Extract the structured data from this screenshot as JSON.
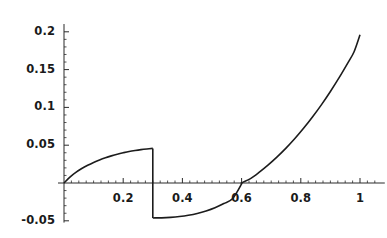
{
  "chart_data": {
    "type": "line",
    "title": "",
    "subtitle": "",
    "xlabel": "",
    "ylabel": "",
    "xlim": [
      0.0,
      1.05
    ],
    "ylim": [
      -0.055,
      0.205
    ],
    "grid": false,
    "legend": "none",
    "axis_style": "mathematica-crossed-axes",
    "x_ticks_major": [
      0.2,
      0.4,
      0.6,
      0.8,
      1
    ],
    "x_tick_labels": [
      "0.2",
      "0.4",
      "0.6",
      "0.8",
      "1"
    ],
    "y_ticks_major": [
      0.2,
      0.15,
      0.1,
      0.05,
      -0.05
    ],
    "y_tick_labels": [
      "0.2",
      "0.15",
      "0.1",
      "0.05",
      "-0.05"
    ],
    "x_minor_tick_step": 0.025,
    "y_minor_tick_step": 0.01,
    "discontinuity_x": 0.3,
    "zero_crossing_x": 0.6,
    "series": [
      {
        "name": "curve",
        "color": "#1c1c1c",
        "line_width": 1.6,
        "segments": [
          {
            "name": "rising-arc-segment",
            "points": [
              [
                0.0,
                0.0
              ],
              [
                0.02,
                0.0078
              ],
              [
                0.04,
                0.014
              ],
              [
                0.06,
                0.0191
              ],
              [
                0.08,
                0.0234
              ],
              [
                0.1,
                0.0272
              ],
              [
                0.12,
                0.0305
              ],
              [
                0.14,
                0.0334
              ],
              [
                0.16,
                0.0359
              ],
              [
                0.18,
                0.0381
              ],
              [
                0.2,
                0.04
              ],
              [
                0.22,
                0.0417
              ],
              [
                0.24,
                0.043
              ],
              [
                0.26,
                0.0441
              ],
              [
                0.28,
                0.045
              ],
              [
                0.3,
                0.0458
              ]
            ]
          },
          {
            "name": "vertical-jump-segment",
            "points": [
              [
                0.3,
                0.0458
              ],
              [
                0.3,
                -0.0462
              ]
            ]
          },
          {
            "name": "rising-parabolic-segment",
            "points": [
              [
                0.3,
                -0.0462
              ],
              [
                0.33,
                -0.0461
              ],
              [
                0.36,
                -0.0455
              ],
              [
                0.39,
                -0.0444
              ],
              [
                0.42,
                -0.0427
              ],
              [
                0.45,
                -0.0403
              ],
              [
                0.48,
                -0.037
              ],
              [
                0.51,
                -0.0327
              ],
              [
                0.54,
                -0.0272
              ],
              [
                0.57,
                -0.0204
              ],
              [
                0.6,
                -0.0012
              ],
              [
                0.6,
                0.0
              ],
              [
                0.63,
                0.0058
              ],
              [
                0.66,
                0.0143
              ],
              [
                0.69,
                0.0239
              ],
              [
                0.72,
                0.0345
              ],
              [
                0.75,
                0.0461
              ],
              [
                0.78,
                0.0588
              ],
              [
                0.81,
                0.0726
              ],
              [
                0.84,
                0.0876
              ],
              [
                0.87,
                0.1037
              ],
              [
                0.9,
                0.1211
              ],
              [
                0.93,
                0.1397
              ],
              [
                0.96,
                0.1596
              ],
              [
                0.98,
                0.1736
              ],
              [
                1.0,
                0.196
              ]
            ]
          }
        ]
      }
    ]
  },
  "axes": {
    "x_axis_name": "horizontal-axis",
    "y_axis_name": "vertical-axis",
    "axis_color": "#2b2b2b"
  }
}
